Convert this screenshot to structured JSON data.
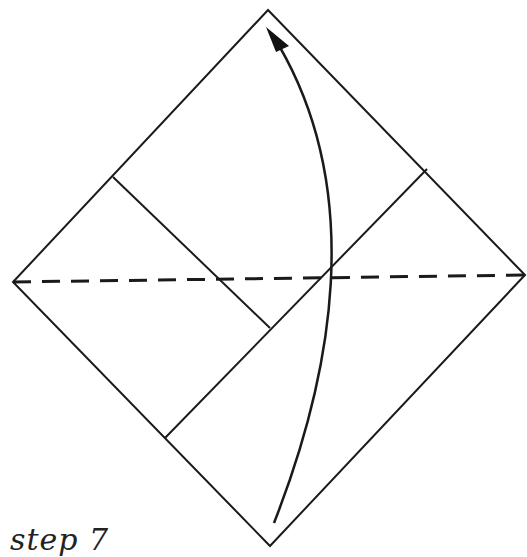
{
  "diagram": {
    "type": "origami-fold-step",
    "caption": "step 7",
    "stroke_color": "#1a1a1a",
    "background": "#ffffff",
    "outline": {
      "top": [
        268,
        10
      ],
      "right": [
        525,
        275
      ],
      "bottom": [
        270,
        546
      ],
      "left": [
        13,
        282
      ]
    },
    "inner_crease": {
      "from": [
        113,
        177
      ],
      "to": [
        270,
        328
      ]
    },
    "flap_edge": {
      "from": [
        165,
        438
      ],
      "to": [
        427,
        169
      ]
    },
    "valley_fold_line": {
      "from": [
        13,
        282
      ],
      "to": [
        525,
        275
      ],
      "style": "dashed"
    },
    "fold_arrow": {
      "tail": [
        274,
        523
      ],
      "control1": [
        360,
        330
      ],
      "control2": [
        370,
        160
      ],
      "head": [
        268,
        28
      ],
      "direction": "up"
    }
  }
}
